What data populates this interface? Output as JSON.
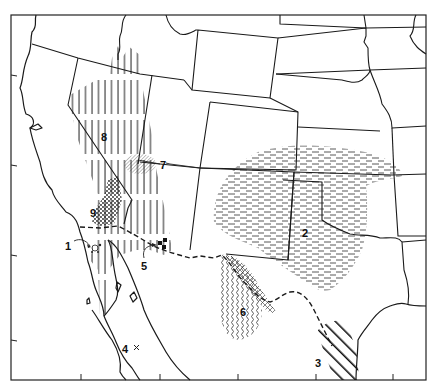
{
  "map": {
    "type": "range map",
    "region": "Southwestern United States and northern Mexico",
    "style": "black and white line map with hatched range areas",
    "colors": {
      "ink": "#1a1a1a",
      "background": "#ffffff"
    },
    "range_labels": [
      {
        "id": "1",
        "text": "1",
        "pattern": "small circles/dots with arrow",
        "location": "northern Baja California coast"
      },
      {
        "id": "2",
        "text": "2",
        "pattern": "horizontal dashes",
        "location": "Texas panhandle / Oklahoma / Kansas / New Mexico"
      },
      {
        "id": "3",
        "text": "3",
        "pattern": "bold diagonal hatching",
        "location": "south Texas Gulf coast"
      },
      {
        "id": "4",
        "text": "4",
        "pattern": "x marker",
        "location": "Baja California Sur"
      },
      {
        "id": "5",
        "text": "5",
        "pattern": "solid squares with arrow",
        "location": "southern Arizona / Sonora border"
      },
      {
        "id": "6",
        "text": "6",
        "pattern": "wavy vertical lines",
        "location": "Trans-Pecos Texas / Chihuahua"
      },
      {
        "id": "7",
        "text": "7",
        "pattern": "fine diagonal hatching with leader line",
        "location": "southern Nevada / Utah / Arizona junction"
      },
      {
        "id": "8",
        "text": "8",
        "pattern": "vertical lines",
        "location": "Nevada / eastern California / western Arizona"
      },
      {
        "id": "9",
        "text": "9",
        "pattern": "stippled dots",
        "location": "southern California"
      }
    ],
    "frame_ticks_bottom": 5
  }
}
